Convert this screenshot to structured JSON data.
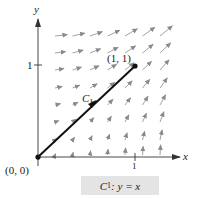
{
  "figure": {
    "axes": {
      "x_label": "x",
      "y_label": "y",
      "x_tick": "1",
      "y_tick": "1"
    },
    "points": {
      "origin_label": "(0, 0)",
      "end_label": "(1, 1)"
    },
    "curve": {
      "name": "C",
      "subscript": "1"
    },
    "caption": {
      "curve_name": "C",
      "curve_subscript": "1",
      "equation": ": y = x"
    },
    "colors": {
      "axis": "#333333",
      "curve": "#111111",
      "field_arrows": "#8a8a8a",
      "caption_bg": "#e4e4e4"
    }
  }
}
